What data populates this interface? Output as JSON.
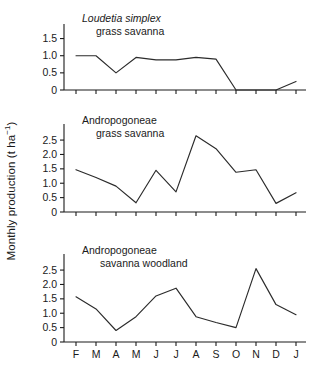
{
  "figure": {
    "ylabel_text": "Monthly production (t ha",
    "ylabel_exp": "−1",
    "ylabel_close": ")",
    "ylabel_full": "Monthly production (t ha−1)"
  },
  "chart_data": [
    {
      "type": "line",
      "title": "Loudetia simplex grass savanna",
      "title_line1": "Loudetia simplex",
      "title_line2": "grass savanna",
      "title_line1_italic": true,
      "xlabel": "",
      "ylabel": "Monthly production (t ha−1)",
      "categories": [
        "F",
        "M",
        "A",
        "M",
        "J",
        "J",
        "A",
        "S",
        "O",
        "N",
        "D",
        "J"
      ],
      "values": [
        1.0,
        1.0,
        0.5,
        0.95,
        0.88,
        0.88,
        0.95,
        0.9,
        0.0,
        0.0,
        0.0,
        0.25
      ],
      "yticks": [
        0,
        0.5,
        1.0,
        1.5
      ],
      "ytick_labels": [
        "0",
        "0.5",
        "1.0",
        "1.5"
      ],
      "ylim": [
        0,
        1.75
      ],
      "grid": false,
      "legend": "none"
    },
    {
      "type": "line",
      "title": "Andropogoneae grass savanna",
      "title_line1": "Andropogoneae",
      "title_line2": "grass savanna",
      "title_line1_italic": false,
      "xlabel": "",
      "ylabel": "Monthly production (t ha−1)",
      "categories": [
        "F",
        "M",
        "A",
        "M",
        "J",
        "J",
        "A",
        "S",
        "O",
        "N",
        "D",
        "J"
      ],
      "values": [
        1.47,
        1.2,
        0.9,
        0.32,
        1.45,
        0.7,
        2.65,
        2.2,
        1.38,
        1.47,
        0.3,
        0.67
      ],
      "yticks": [
        0,
        0.5,
        1.0,
        1.5,
        2.0,
        2.5
      ],
      "ytick_labels": [
        "0",
        "0.5",
        "1.0",
        "1.5",
        "2.0",
        "2.5"
      ],
      "ylim": [
        0,
        2.85
      ],
      "grid": false,
      "legend": "none"
    },
    {
      "type": "line",
      "title": "Andropogoneae savanna woodland",
      "title_line1": "Andropogoneae",
      "title_line2": "savanna woodland",
      "title_line1_italic": false,
      "xlabel": "",
      "ylabel": "Monthly production (t ha−1)",
      "categories": [
        "F",
        "M",
        "A",
        "M",
        "J",
        "J",
        "A",
        "S",
        "O",
        "N",
        "D",
        "J"
      ],
      "values": [
        1.57,
        1.15,
        0.4,
        0.88,
        1.6,
        1.87,
        0.88,
        0.68,
        0.5,
        2.55,
        1.3,
        0.95
      ],
      "yticks": [
        0,
        0.5,
        1.0,
        1.5,
        2.0,
        2.5
      ],
      "ytick_labels": [
        "0",
        "0.5",
        "1.0",
        "1.5",
        "2.0",
        "2.5"
      ],
      "ylim": [
        0,
        2.85
      ],
      "grid": false,
      "legend": "none"
    }
  ],
  "colors": {
    "line": "#2b2b2b",
    "axis": "#1a1a1a",
    "text": "#1a1a1a",
    "background": "#ffffff"
  }
}
